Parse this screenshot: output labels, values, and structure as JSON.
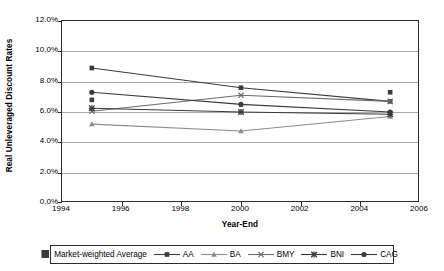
{
  "chart_data": {
    "type": "line",
    "title": "",
    "xlabel": "Year-End",
    "ylabel": "Real Unleveraged Discount Rates",
    "xlim": [
      1994,
      2006
    ],
    "ylim": [
      0.0,
      12.0
    ],
    "xticks": [
      "1994",
      "1996",
      "1998",
      "2000",
      "2002",
      "2004",
      "2006"
    ],
    "yticks": [
      "0.0%",
      "2.0%",
      "4.0%",
      "6.0%",
      "8.0%",
      "10.0%",
      "12.0%"
    ],
    "grid": "horizontal",
    "legend_position": "bottom",
    "x": [
      1995,
      2000,
      2005
    ],
    "series": [
      {
        "name": "Market-weighted Average",
        "marker": "square",
        "line": false,
        "values": [
          6.8,
          null,
          7.3
        ]
      },
      {
        "name": "AA",
        "marker": "square",
        "line": true,
        "values": [
          8.9,
          7.6,
          6.7
        ]
      },
      {
        "name": "BA",
        "marker": "triangle",
        "line": true,
        "values": [
          5.2,
          4.75,
          5.7
        ]
      },
      {
        "name": "BMY",
        "marker": "x",
        "line": true,
        "values": [
          6.05,
          7.1,
          6.7
        ]
      },
      {
        "name": "BNI",
        "marker": "star",
        "line": true,
        "values": [
          6.25,
          6.0,
          5.85
        ]
      },
      {
        "name": "CAG",
        "marker": "circle",
        "line": true,
        "values": [
          7.3,
          6.5,
          6.0
        ]
      }
    ]
  },
  "legend": {
    "items": [
      {
        "label": "Market-weighted Average"
      },
      {
        "label": "AA"
      },
      {
        "label": "BA"
      },
      {
        "label": "BMY"
      },
      {
        "label": "BNI"
      },
      {
        "label": "CAG"
      }
    ]
  },
  "colors": {
    "axis": "#2b2b2b",
    "grid": "#a9a9a9",
    "series_dark": "#3a3a3a",
    "series_mid": "#6b6b6b",
    "series_light": "#8c8c8c",
    "background": "#ffffff"
  }
}
